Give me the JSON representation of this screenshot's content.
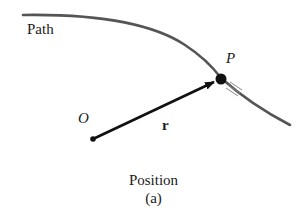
{
  "figure": {
    "labels": {
      "path": "Path",
      "point": "P",
      "origin": "O",
      "vector": "r"
    },
    "caption": {
      "title": "Position",
      "sub": "(a)"
    },
    "colors": {
      "curve": "#555555",
      "vector": "#111111",
      "text": "#1a1a1a"
    }
  }
}
